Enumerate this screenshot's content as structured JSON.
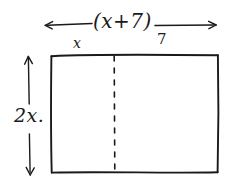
{
  "diagram": {
    "background_color": "#ffffff",
    "ink_color": "#1a1a1a",
    "style": "hand-drawn",
    "labels": {
      "width_expression": "(x+7)",
      "segment_left": "x",
      "segment_right": "7",
      "height_expression": "2x."
    },
    "rectangle": {
      "left": 51,
      "top": 55,
      "right": 218,
      "bottom": 172
    },
    "divider": {
      "type": "dashed-vertical",
      "x": 114
    },
    "width_arrow": {
      "type": "double-headed-horizontal",
      "x_start": 45,
      "x_end": 216,
      "y": 25
    },
    "height_arrow": {
      "type": "double-headed-vertical",
      "x": 28,
      "y_start": 57,
      "y_end": 175
    }
  }
}
